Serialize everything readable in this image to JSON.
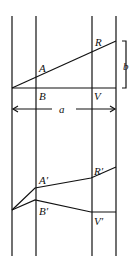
{
  "diagram": {
    "vertical_lines_x": [
      12,
      36,
      92,
      116
    ],
    "vertical_top": 16,
    "vertical_bottom": 256,
    "top_figure": {
      "labels": {
        "A": "A",
        "B": "B",
        "R": "R",
        "V": "V",
        "a": "a",
        "b": "b"
      }
    },
    "bottom_figure": {
      "labels": {
        "A_prime": "A′",
        "B_prime": "B′",
        "R_prime": "R′",
        "V_prime": "V′"
      }
    },
    "stroke_color": "#111111",
    "background": "#ffffff"
  }
}
